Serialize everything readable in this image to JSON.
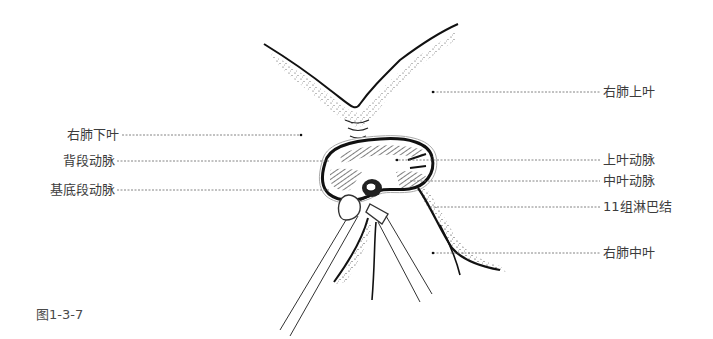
{
  "figure": {
    "caption": "图1-3-7",
    "labels_left": [
      {
        "id": "right-lower-lobe",
        "text": "右肺下叶"
      },
      {
        "id": "superior-segment-artery",
        "text": "背段动脉"
      },
      {
        "id": "basal-segment-artery",
        "text": "基底段动脉"
      }
    ],
    "labels_right": [
      {
        "id": "right-upper-lobe",
        "text": "右肺上叶"
      },
      {
        "id": "upper-lobe-artery",
        "text": "上叶动脉"
      },
      {
        "id": "middle-lobe-artery",
        "text": "中叶动脉"
      },
      {
        "id": "station-11-lymph-node",
        "text": "11组淋巴结"
      },
      {
        "id": "right-middle-lobe",
        "text": "右肺中叶"
      }
    ],
    "colors": {
      "ink": "#111111",
      "leader": "#555555",
      "text": "#3c3c3c"
    }
  }
}
